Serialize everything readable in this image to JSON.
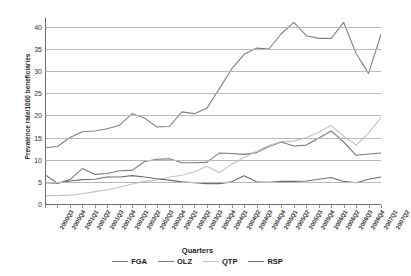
{
  "chart_data": {
    "type": "line",
    "title": "",
    "xlabel": "Quarters",
    "ylabel": "Prevalence rate/1000 beneficiaries",
    "ylim": [
      0,
      42
    ],
    "yticks": [
      0,
      5,
      10,
      15,
      20,
      25,
      30,
      35,
      40
    ],
    "grid": true,
    "legend_position": "bottom",
    "categories": [
      "2000Q3",
      "2000Q4",
      "2001Q1",
      "2001Q2",
      "2001Q3",
      "2001Q4",
      "2002Q1",
      "2002Q2",
      "2002Q3",
      "2002Q4",
      "2003Q1",
      "2003Q2",
      "2003Q3",
      "2003Q4",
      "2004Q1",
      "2004Q2",
      "2004Q3",
      "2004Q4",
      "2005Q1",
      "2005Q2",
      "2005Q3",
      "2005Q4",
      "2006Q1",
      "2006Q2",
      "2006Q3",
      "2006Q4",
      "2007Q1",
      "2007Q2"
    ],
    "series": [
      {
        "name": "FGA",
        "color": "#808080",
        "values": [
          12.7,
          13.0,
          15.0,
          16.3,
          16.5,
          17.0,
          17.8,
          20.4,
          19.4,
          17.4,
          17.5,
          20.8,
          20.4,
          21.6,
          26.0,
          30.5,
          33.8,
          35.2,
          35.0,
          38.5,
          41.0,
          38.0,
          37.4,
          37.4,
          41.0,
          34.0,
          29.5,
          38.3
        ]
      },
      {
        "name": "OLZ",
        "color": "#7a7a7a",
        "values": [
          6.6,
          4.7,
          5.5,
          8.0,
          6.7,
          6.9,
          7.5,
          7.6,
          9.6,
          10.1,
          10.2,
          9.3,
          9.3,
          9.4,
          11.5,
          11.4,
          11.2,
          11.6,
          13.0,
          14.0,
          13.1,
          13.3,
          14.9,
          16.5,
          14.0,
          11.0,
          11.3,
          11.5
        ]
      },
      {
        "name": "QTP",
        "color": "#c3c3c3",
        "values": [
          1.9,
          1.9,
          2.0,
          2.3,
          2.8,
          3.2,
          3.8,
          4.5,
          5.1,
          5.4,
          6.1,
          6.5,
          7.3,
          8.5,
          7.1,
          9.0,
          10.5,
          11.9,
          13.2,
          14.1,
          14.2,
          15.0,
          16.2,
          17.7,
          15.3,
          13.3,
          16.0,
          19.5
        ]
      },
      {
        "name": "RSP",
        "color": "#6e6e6e",
        "values": [
          4.8,
          4.7,
          5.2,
          5.5,
          5.6,
          6.1,
          6.1,
          6.4,
          6.1,
          5.7,
          5.4,
          5.0,
          4.8,
          4.6,
          4.6,
          5.0,
          6.4,
          5.0,
          4.9,
          5.1,
          5.1,
          5.2,
          5.6,
          6.0,
          5.1,
          4.8,
          5.6,
          6.1
        ]
      }
    ]
  },
  "axis": {
    "ytick_labels": [
      "0",
      "5",
      "10",
      "15",
      "20",
      "25",
      "30",
      "35",
      "40"
    ],
    "xaxis_title": "Quarters",
    "yaxis_title": "Prevalence rate/1000 beneficiaries"
  },
  "legend": {
    "items": [
      {
        "label": "FGA"
      },
      {
        "label": "OLZ"
      },
      {
        "label": "QTP"
      },
      {
        "label": "RSP"
      }
    ]
  }
}
